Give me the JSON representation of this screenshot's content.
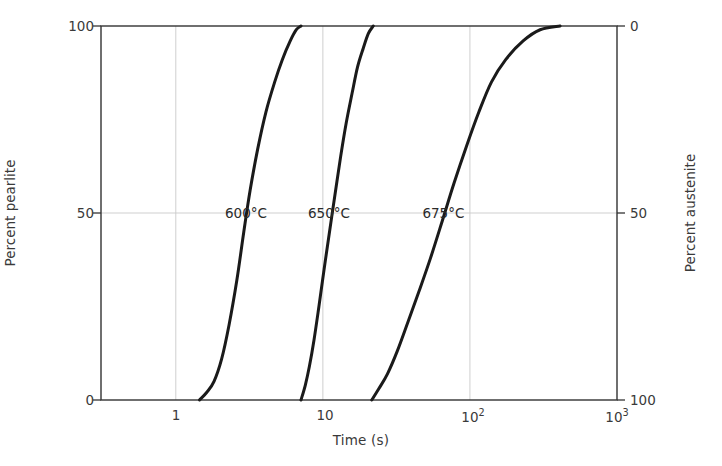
{
  "chart_data": {
    "type": "line",
    "title": "",
    "xlabel": "Time (s)",
    "ylabel": "Percent pearlite",
    "ylabel_right": "Percent austenite",
    "xscale": "log",
    "xlim": [
      0.31,
      1000
    ],
    "ylim": [
      0,
      100
    ],
    "ylim_right": [
      100,
      0
    ],
    "grid": true,
    "legend": "inline-annotations",
    "xticks": [
      {
        "value": 1,
        "label": "1"
      },
      {
        "value": 10,
        "label": "10"
      },
      {
        "value": 100,
        "label": "10",
        "exponent": "2"
      },
      {
        "value": 1000,
        "label": "10",
        "exponent": "3"
      }
    ],
    "yticks_left": [
      {
        "value": 0,
        "label": "0"
      },
      {
        "value": 50,
        "label": "50"
      },
      {
        "value": 100,
        "label": "100"
      }
    ],
    "yticks_right": [
      {
        "value": 0,
        "label": "0"
      },
      {
        "value": 50,
        "label": "50"
      },
      {
        "value": 100,
        "label": "100"
      }
    ],
    "series": [
      {
        "name": "600°C",
        "label": "600°C",
        "color": "#1a1a1a",
        "annotation_at": {
          "time": 3.0,
          "percent": 50
        },
        "points": [
          {
            "t": 1.45,
            "p": 0
          },
          {
            "t": 1.62,
            "p": 2
          },
          {
            "t": 1.82,
            "p": 5
          },
          {
            "t": 2.05,
            "p": 11
          },
          {
            "t": 2.3,
            "p": 20
          },
          {
            "t": 2.6,
            "p": 32
          },
          {
            "t": 2.9,
            "p": 45
          },
          {
            "t": 3.2,
            "p": 56
          },
          {
            "t": 3.6,
            "p": 67
          },
          {
            "t": 4.1,
            "p": 77
          },
          {
            "t": 4.7,
            "p": 85
          },
          {
            "t": 5.3,
            "p": 91
          },
          {
            "t": 6.0,
            "p": 96
          },
          {
            "t": 6.6,
            "p": 99
          },
          {
            "t": 7.1,
            "p": 100
          }
        ]
      },
      {
        "name": "650°C",
        "label": "650°C",
        "color": "#1a1a1a",
        "annotation_at": {
          "time": 11.0,
          "percent": 50
        },
        "points": [
          {
            "t": 7.1,
            "p": 0
          },
          {
            "t": 7.6,
            "p": 4
          },
          {
            "t": 8.1,
            "p": 9
          },
          {
            "t": 8.7,
            "p": 16
          },
          {
            "t": 9.4,
            "p": 25
          },
          {
            "t": 10.2,
            "p": 35
          },
          {
            "t": 11.1,
            "p": 45
          },
          {
            "t": 12.1,
            "p": 55
          },
          {
            "t": 13.2,
            "p": 65
          },
          {
            "t": 14.4,
            "p": 74
          },
          {
            "t": 15.8,
            "p": 82
          },
          {
            "t": 17.2,
            "p": 89
          },
          {
            "t": 18.8,
            "p": 94
          },
          {
            "t": 20.4,
            "p": 98
          },
          {
            "t": 22.0,
            "p": 100
          }
        ]
      },
      {
        "name": "675°C",
        "label": "675°C",
        "color": "#1a1a1a",
        "annotation_at": {
          "time": 66.0,
          "percent": 50
        },
        "points": [
          {
            "t": 21.5,
            "p": 0
          },
          {
            "t": 24.0,
            "p": 3
          },
          {
            "t": 27.5,
            "p": 7
          },
          {
            "t": 32.0,
            "p": 13
          },
          {
            "t": 38.0,
            "p": 21
          },
          {
            "t": 45.0,
            "p": 29
          },
          {
            "t": 54.0,
            "p": 38
          },
          {
            "t": 65.0,
            "p": 48
          },
          {
            "t": 78.0,
            "p": 58
          },
          {
            "t": 95.0,
            "p": 68
          },
          {
            "t": 115.0,
            "p": 77
          },
          {
            "t": 140.0,
            "p": 85
          },
          {
            "t": 175.0,
            "p": 91
          },
          {
            "t": 230.0,
            "p": 96
          },
          {
            "t": 300.0,
            "p": 99
          },
          {
            "t": 410.0,
            "p": 100
          }
        ]
      }
    ],
    "axis_color": "#333333",
    "grid_color": "#c9c9c9"
  }
}
